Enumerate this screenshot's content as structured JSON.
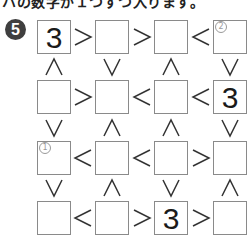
{
  "instruction": "ハの数字が１つずつ入ります。",
  "problem_number": "5",
  "colors": {
    "badge": "#3f3f3f",
    "border": "#8a8a8a",
    "hint": "#9a9a9a",
    "sign": "#333333"
  },
  "grid": {
    "rows": [
      [
        {
          "value": "3"
        },
        {
          "value": ""
        },
        {
          "value": ""
        },
        {
          "value": "",
          "hint": "②"
        }
      ],
      [
        {
          "value": ""
        },
        {
          "value": ""
        },
        {
          "value": ""
        },
        {
          "value": "3"
        }
      ],
      [
        {
          "value": "",
          "hint": "①"
        },
        {
          "value": ""
        },
        {
          "value": ""
        },
        {
          "value": ""
        }
      ],
      [
        {
          "value": ""
        },
        {
          "value": ""
        },
        {
          "value": "3"
        },
        {
          "value": ""
        }
      ]
    ],
    "horizontal_signs": [
      [
        ">",
        ">",
        "<"
      ],
      [
        ">",
        "<",
        "<"
      ],
      [
        "<",
        "<",
        ">"
      ],
      [
        "<",
        ">",
        ">"
      ]
    ],
    "vertical_signs": [
      [
        "∧",
        "∨",
        "∧",
        "∨"
      ],
      [
        "∨",
        "∧",
        "∧",
        "∨"
      ],
      [
        "∨",
        "∧",
        "∨",
        "∧"
      ]
    ]
  }
}
